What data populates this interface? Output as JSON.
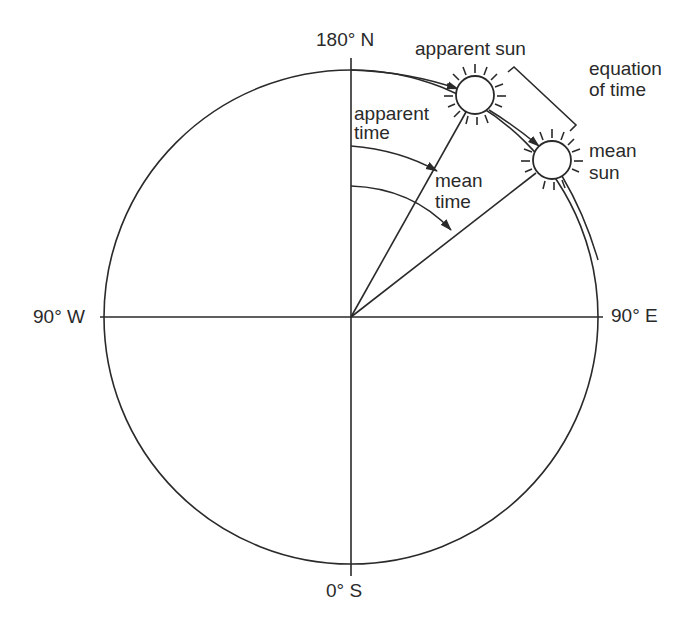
{
  "diagram": {
    "compass": {
      "north": "180° N",
      "south": "0° S",
      "west": "90° W",
      "east": "90° E"
    },
    "labels": {
      "apparent_sun": "apparent sun",
      "mean_sun_line1": "mean",
      "mean_sun_line2": "sun",
      "equation_line1": "equation",
      "equation_line2": "of time",
      "apparent_time_line1": "apparent",
      "apparent_time_line2": "time",
      "mean_time_line1": "mean",
      "mean_time_line2": "time"
    },
    "colors": {
      "stroke": "#2a2a2a",
      "background": "#ffffff"
    }
  }
}
